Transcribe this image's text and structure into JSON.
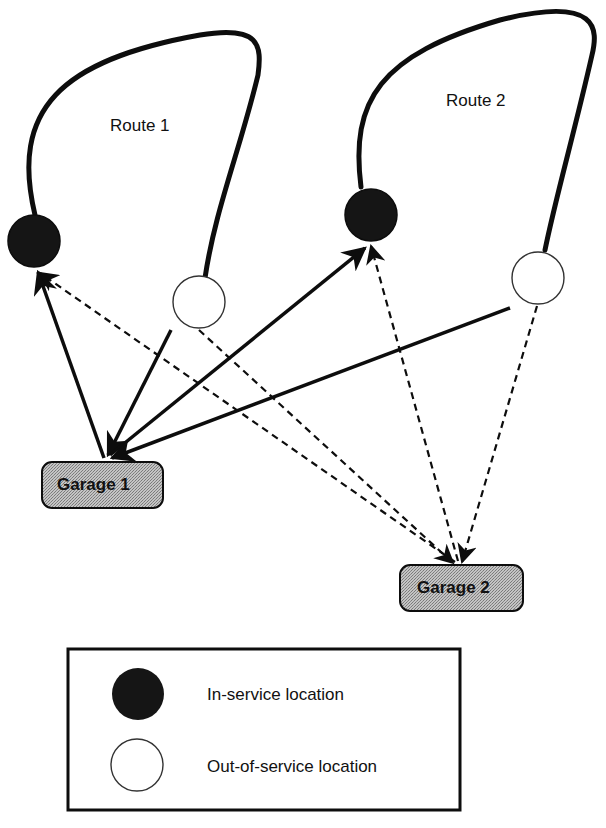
{
  "routes": [
    {
      "label": "Route 1"
    },
    {
      "label": "Route 2"
    }
  ],
  "garages": [
    {
      "label": "Garage 1"
    },
    {
      "label": "Garage 2"
    }
  ],
  "legend": {
    "items": [
      {
        "symbol": "filled-circle",
        "label": "In-service location"
      },
      {
        "symbol": "open-circle",
        "label": "Out-of-service location"
      }
    ]
  },
  "edge_styles": {
    "solid": "trips to/from Garage 1",
    "dashed": "trips to/from Garage 2"
  },
  "colors": {
    "line": "#0d0d0d",
    "in_service_fill": "#151515",
    "out_service_fill": "#ffffff",
    "garage_fill": "#b9b9b9"
  }
}
